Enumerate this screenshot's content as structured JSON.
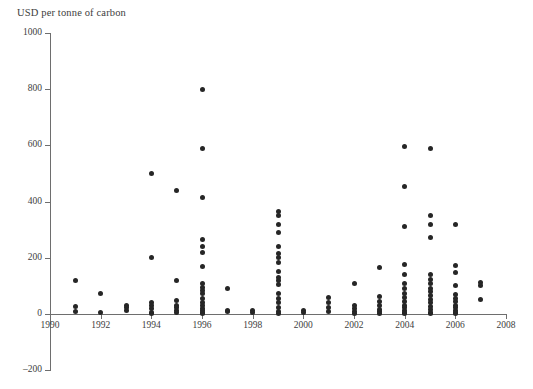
{
  "chart_data": {
    "type": "scatter",
    "title": "",
    "ylabel": "USD per tonne of carbon",
    "xlabel": "",
    "xlim": [
      1990,
      2008
    ],
    "ylim": [
      -200,
      1000
    ],
    "grid": false,
    "legend": "none",
    "y_ticks": [
      1000,
      800,
      600,
      400,
      200,
      0,
      -200
    ],
    "y_tick_labels": [
      "1000",
      "800",
      "600",
      "400",
      "200",
      "0",
      "–200"
    ],
    "x_ticks": [
      1990,
      1992,
      1994,
      1996,
      1998,
      2000,
      2002,
      2004,
      2006,
      2008
    ],
    "x_tick_labels": [
      "1990",
      "1992",
      "1994",
      "1996",
      "1998",
      "2000",
      "2002",
      "2004",
      "2006",
      "2008"
    ],
    "marker": {
      "shape": "circle",
      "color": "#262626",
      "size_px": 5
    },
    "axis_color": "#6e6e6e",
    "series": [
      {
        "name": "estimates",
        "points": [
          [
            1991,
            120
          ],
          [
            1991,
            27
          ],
          [
            1991,
            8
          ],
          [
            1992,
            72
          ],
          [
            1992,
            4
          ],
          [
            1993,
            30
          ],
          [
            1993,
            22
          ],
          [
            1993,
            12
          ],
          [
            1994,
            500
          ],
          [
            1994,
            200
          ],
          [
            1994,
            42
          ],
          [
            1994,
            30
          ],
          [
            1994,
            18
          ],
          [
            1994,
            7
          ],
          [
            1994,
            3
          ],
          [
            1995,
            440
          ],
          [
            1995,
            120
          ],
          [
            1995,
            48
          ],
          [
            1995,
            32
          ],
          [
            1995,
            22
          ],
          [
            1995,
            12
          ],
          [
            1995,
            5
          ],
          [
            1996,
            800
          ],
          [
            1996,
            590
          ],
          [
            1996,
            415
          ],
          [
            1996,
            265
          ],
          [
            1996,
            240
          ],
          [
            1996,
            218
          ],
          [
            1996,
            170
          ],
          [
            1996,
            108
          ],
          [
            1996,
            96
          ],
          [
            1996,
            84
          ],
          [
            1996,
            72
          ],
          [
            1996,
            55
          ],
          [
            1996,
            40
          ],
          [
            1996,
            30
          ],
          [
            1996,
            20
          ],
          [
            1996,
            12
          ],
          [
            1996,
            6
          ],
          [
            1996,
            2
          ],
          [
            1997,
            92
          ],
          [
            1997,
            14
          ],
          [
            1997,
            8
          ],
          [
            1998,
            12
          ],
          [
            1998,
            4
          ],
          [
            1999,
            365
          ],
          [
            1999,
            350
          ],
          [
            1999,
            320
          ],
          [
            1999,
            290
          ],
          [
            1999,
            240
          ],
          [
            1999,
            215
          ],
          [
            1999,
            200
          ],
          [
            1999,
            185
          ],
          [
            1999,
            150
          ],
          [
            1999,
            130
          ],
          [
            1999,
            118
          ],
          [
            1999,
            105
          ],
          [
            1999,
            72
          ],
          [
            1999,
            55
          ],
          [
            1999,
            40
          ],
          [
            1999,
            22
          ],
          [
            1999,
            10
          ],
          [
            1999,
            3
          ],
          [
            2000,
            14
          ],
          [
            2000,
            4
          ],
          [
            2001,
            60
          ],
          [
            2001,
            42
          ],
          [
            2001,
            22
          ],
          [
            2001,
            8
          ],
          [
            2002,
            108
          ],
          [
            2002,
            30
          ],
          [
            2002,
            18
          ],
          [
            2002,
            8
          ],
          [
            2002,
            2
          ],
          [
            2003,
            165
          ],
          [
            2003,
            62
          ],
          [
            2003,
            45
          ],
          [
            2003,
            30
          ],
          [
            2003,
            16
          ],
          [
            2003,
            8
          ],
          [
            2003,
            2
          ],
          [
            2004,
            595
          ],
          [
            2004,
            455
          ],
          [
            2004,
            310
          ],
          [
            2004,
            175
          ],
          [
            2004,
            140
          ],
          [
            2004,
            110
          ],
          [
            2004,
            92
          ],
          [
            2004,
            72
          ],
          [
            2004,
            58
          ],
          [
            2004,
            44
          ],
          [
            2004,
            32
          ],
          [
            2004,
            22
          ],
          [
            2004,
            14
          ],
          [
            2004,
            6
          ],
          [
            2004,
            1
          ],
          [
            2005,
            588
          ],
          [
            2005,
            350
          ],
          [
            2005,
            320
          ],
          [
            2005,
            272
          ],
          [
            2005,
            140
          ],
          [
            2005,
            122
          ],
          [
            2005,
            108
          ],
          [
            2005,
            92
          ],
          [
            2005,
            80
          ],
          [
            2005,
            66
          ],
          [
            2005,
            52
          ],
          [
            2005,
            40
          ],
          [
            2005,
            28
          ],
          [
            2005,
            16
          ],
          [
            2005,
            6
          ],
          [
            2005,
            1
          ],
          [
            2006,
            318
          ],
          [
            2006,
            172
          ],
          [
            2006,
            148
          ],
          [
            2006,
            100
          ],
          [
            2006,
            70
          ],
          [
            2006,
            56
          ],
          [
            2006,
            44
          ],
          [
            2006,
            32
          ],
          [
            2006,
            22
          ],
          [
            2006,
            14
          ],
          [
            2006,
            7
          ],
          [
            2006,
            2
          ],
          [
            2007,
            112
          ],
          [
            2007,
            100
          ],
          [
            2007,
            50
          ]
        ]
      }
    ]
  }
}
